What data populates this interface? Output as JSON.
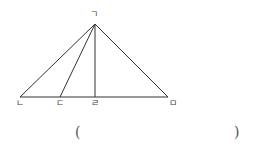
{
  "diagram": {
    "type": "triangle-with-cevians",
    "stroke_color": "#333333",
    "points": {
      "apex": {
        "label": "ㄱ",
        "x": 95,
        "y": 24
      },
      "left": {
        "label": "ㄴ",
        "x": 20,
        "y": 97
      },
      "mid1": {
        "label": "ㄷ",
        "x": 60,
        "y": 97
      },
      "foot": {
        "label": "ㄹ",
        "x": 95,
        "y": 97
      },
      "right": {
        "label": "ㅁ",
        "x": 168,
        "y": 97
      }
    },
    "segments": [
      [
        "ㄱ",
        "ㄴ"
      ],
      [
        "ㄱ",
        "ㄷ"
      ],
      [
        "ㄱ",
        "ㄹ"
      ],
      [
        "ㄱ",
        "ㅁ"
      ],
      [
        "ㄴ",
        "ㅁ"
      ]
    ]
  },
  "answer": {
    "open_paren": "(",
    "close_paren": ")",
    "value": ""
  }
}
